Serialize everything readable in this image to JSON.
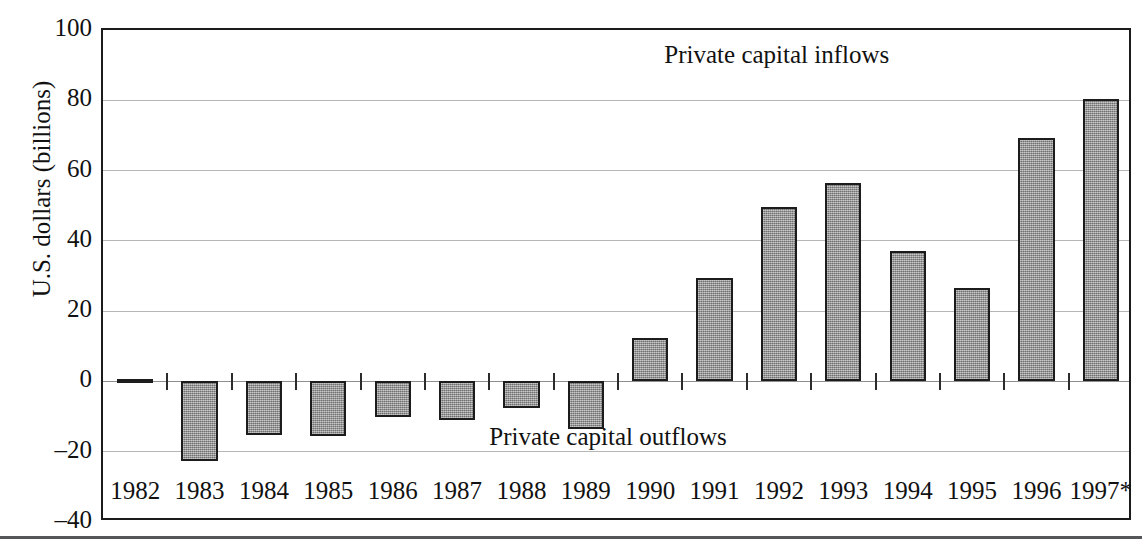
{
  "chart_data": {
    "type": "bar",
    "title": "",
    "xlabel": "",
    "ylabel": "U.S. dollars (billions)",
    "categories": [
      "1982",
      "1983",
      "1984",
      "1985",
      "1986",
      "1987",
      "1988",
      "1989",
      "1990",
      "1991",
      "1992",
      "1993",
      "1994",
      "1995",
      "1996",
      "1997*"
    ],
    "values": [
      -0.5,
      -22.6,
      -15.3,
      -15.5,
      -10.0,
      -11.0,
      -7.5,
      -13.5,
      12.3,
      29.3,
      49.5,
      56.5,
      37.0,
      26.5,
      69.3,
      80.5
    ],
    "ylim": [
      -40,
      100
    ],
    "ytick_labels": [
      "100",
      "80",
      "60",
      "40",
      "20",
      "0",
      "–20",
      "–40"
    ],
    "ytick_values": [
      100,
      80,
      60,
      40,
      20,
      0,
      -20,
      -40
    ],
    "grid": true,
    "legend_position": "none",
    "annotations": [
      {
        "text": "Private capital inflows",
        "x_frac": 0.545,
        "y_value": 93
      },
      {
        "text": "Private capital outflows",
        "x_frac": 0.375,
        "y_value": -15.8
      }
    ],
    "bar_color": "#9a9a9a",
    "bar_edge_color": "#1c1c1c",
    "grid_color": "#b6b6b6",
    "axis_color": "#1b1b1b"
  }
}
